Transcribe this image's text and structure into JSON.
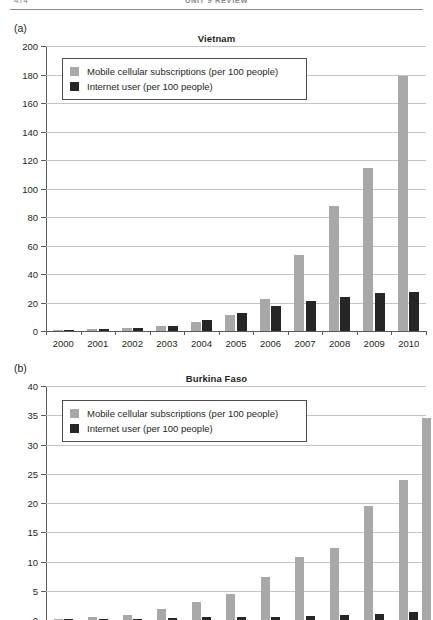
{
  "header": {
    "folio": "474",
    "title": "UNIT 9 REVIEW"
  },
  "legend": {
    "mobile_label": "Mobile cellular subscriptions (per 100 people)",
    "internet_label": "Internet user (per 100 people)",
    "mobile_color": "#a8a8a8",
    "internet_color": "#262626"
  },
  "panels": [
    {
      "letter": "(a)",
      "title": "Vietnam"
    },
    {
      "letter": "(b)",
      "title": "Burkina Faso"
    }
  ],
  "chart_data": [
    {
      "type": "bar",
      "title": "Vietnam",
      "panel": "(a)",
      "xlabel": "",
      "ylabel": "",
      "ylim": [
        0,
        200
      ],
      "yticks": [
        0,
        20,
        40,
        60,
        80,
        100,
        120,
        140,
        160,
        180,
        200
      ],
      "ytick_labels": [
        "0",
        "20",
        "40",
        "60",
        "80",
        "100",
        "120",
        "140",
        "160",
        "180",
        "200"
      ],
      "grid": true,
      "legend_position": "upper-left",
      "categories": [
        "2000",
        "2001",
        "2002",
        "2003",
        "2004",
        "2005",
        "2006",
        "2007",
        "2008",
        "2009",
        "2010"
      ],
      "series": [
        {
          "name": "Mobile cellular subscriptions (per 100 people)",
          "color": "#a8a8a8",
          "values": [
            0.9,
            1.5,
            2.3,
            3.4,
            6.0,
            11.4,
            22.6,
            53.6,
            88.0,
            114.7,
            179.0
          ]
        },
        {
          "name": "Internet user (per 100 people)",
          "color": "#262626",
          "values": [
            0.3,
            1.3,
            1.9,
            3.8,
            7.6,
            12.7,
            17.3,
            20.8,
            23.9,
            26.6,
            27.6
          ]
        }
      ]
    },
    {
      "type": "bar",
      "title": "Burkina Faso",
      "panel": "(b)",
      "xlabel": "",
      "ylabel": "",
      "ylim": [
        0,
        40
      ],
      "yticks": [
        0,
        5,
        10,
        15,
        20,
        25,
        30,
        35,
        40
      ],
      "ytick_labels": [
        "0",
        "5",
        "10",
        "15",
        "20",
        "25",
        "30",
        "35",
        "40"
      ],
      "grid": true,
      "legend_position": "upper-left",
      "visible_ytick_labels": [
        "10",
        "15",
        "20",
        "25",
        "30",
        "35",
        "40"
      ],
      "note": "panel cropped by image bottom edge just below the 10 gridline",
      "categories": [
        "2000",
        "2001",
        "2002",
        "2003",
        "2004",
        "2005",
        "2006",
        "2007",
        "2008",
        "2009",
        "2010"
      ],
      "series": [
        {
          "name": "Mobile cellular subscriptions (per 100 people)",
          "color": "#a8a8a8",
          "values": [
            0.2,
            0.6,
            0.9,
            1.9,
            3.0,
            4.5,
            7.4,
            10.8,
            12.3,
            19.5,
            23.9
          ]
        },
        {
          "name": "Internet user (per 100 people)",
          "color": "#262626",
          "values": [
            0.1,
            0.2,
            0.2,
            0.4,
            0.5,
            0.5,
            0.6,
            0.7,
            0.9,
            1.1,
            1.4
          ]
        }
      ],
      "extra_bar": {
        "name": "rightmost mobile bar",
        "value": 34.6
      }
    }
  ]
}
